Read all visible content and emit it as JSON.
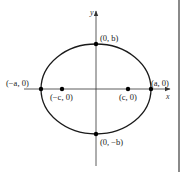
{
  "diagram": {
    "axes": {
      "x_label": "x",
      "y_label": "y"
    },
    "points": {
      "left_vertex": "(−a, 0)",
      "right_vertex": "(a, 0)",
      "top_covertex": "(0, b)",
      "bottom_covertex": "(0, −b)",
      "left_focus": "(−c, 0)",
      "right_focus": "(c, 0)"
    },
    "colors": {
      "ink": "#1a1a1a",
      "border": "#8a8a8a",
      "background": "#ffffff"
    }
  }
}
